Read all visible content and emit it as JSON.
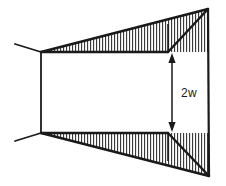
{
  "figure": {
    "background_color": "#ffffff",
    "line_color": "#1a1a1a",
    "hatch_color": "#2b2b2b"
  },
  "annotations": {
    "dimension_label": "2w"
  },
  "geometry": {
    "canvas": {
      "width": 226,
      "height": 186
    },
    "vertices": {
      "left_top_vertex": {
        "x": 41,
        "y": 52
      },
      "left_bottom_vertex": {
        "x": 41,
        "y": 133
      },
      "top_right_corner": {
        "x": 208,
        "y": 9
      },
      "bottom_right_corner": {
        "x": 209,
        "y": 176
      },
      "top_step_point": {
        "x": 168,
        "y": 52
      },
      "bottom_step_point": {
        "x": 168,
        "y": 133
      },
      "top_stub_end": {
        "x": 15,
        "y": 44
      },
      "bottom_stub_end": {
        "x": 15,
        "y": 141
      }
    },
    "hatching": {
      "orientation": "vertical",
      "spacing_px": 3,
      "stroke_width_px": 1
    },
    "dimension_arrow": {
      "x": 172,
      "y_top": 57,
      "y_bottom": 128,
      "double_headed": true,
      "label_x": 182,
      "label_y": 97
    }
  }
}
